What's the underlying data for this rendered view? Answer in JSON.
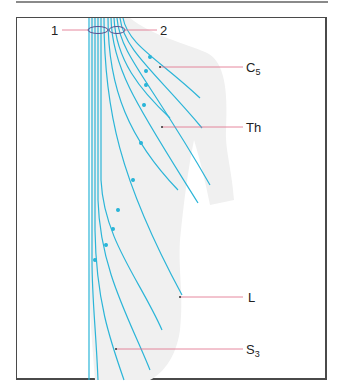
{
  "figure": {
    "labels": {
      "marker_1": "1",
      "marker_2": "2",
      "c": "C",
      "c_sub": "5",
      "th": "Th",
      "l": "L",
      "s": "S",
      "s_sub": "3"
    },
    "colors": {
      "nerve_line": "#2bb5d8",
      "leader_line": "#e06a85",
      "ellipse": "#5a4f8f",
      "silhouette": "#efefef",
      "frame": "#4a4a4a"
    }
  }
}
